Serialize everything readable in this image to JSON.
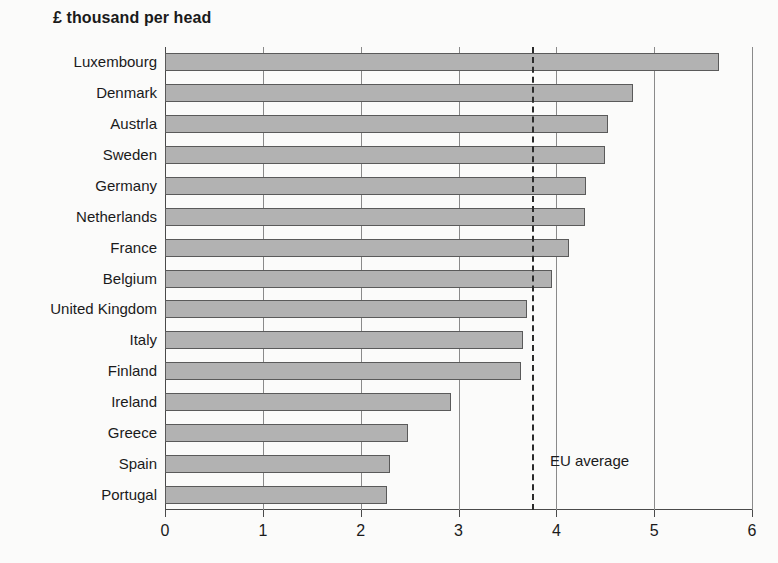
{
  "title": "£ thousand per head",
  "annotation": {
    "eu_average_label": "EU average",
    "eu_average_value": 3.75
  },
  "colors": {
    "bar_fill": "#b2b2b2",
    "bar_border": "#5a5a5a",
    "axis": "#4a4a4a",
    "gridline": "#8a8a8a",
    "background": "#fbfbfa",
    "text": "#1a1a1a"
  },
  "chart_data": {
    "type": "bar",
    "orientation": "horizontal",
    "title": "£ thousand per head",
    "xlabel": "",
    "ylabel": "",
    "xlim": [
      0,
      6
    ],
    "xticks": [
      0,
      1,
      2,
      3,
      4,
      5,
      6
    ],
    "xticklabels": [
      "0",
      "1",
      "2",
      "3",
      "4",
      "5",
      "6"
    ],
    "grid": "vertical",
    "legend": "none",
    "categories": [
      "Luxembourg",
      "Denmark",
      "Austrla",
      "Sweden",
      "Germany",
      "Netherlands",
      "France",
      "Belgium",
      "United Kingdom",
      "Italy",
      "Finland",
      "Ireland",
      "Greece",
      "Spain",
      "Portugal"
    ],
    "values": [
      5.66,
      4.78,
      4.53,
      4.5,
      4.3,
      4.29,
      4.13,
      3.96,
      3.7,
      3.66,
      3.64,
      2.92,
      2.48,
      2.3,
      2.27
    ],
    "annotations": [
      {
        "type": "vline",
        "label": "EU average",
        "value": 3.75,
        "style": "dashed"
      }
    ]
  }
}
